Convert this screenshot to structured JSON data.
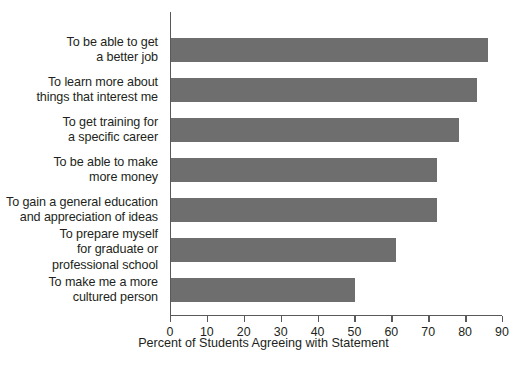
{
  "chart_data": {
    "type": "bar",
    "orientation": "horizontal",
    "title": "",
    "xlabel": "Percent of Students Agreeing with Statement",
    "ylabel": "",
    "xlim": [
      0,
      90
    ],
    "xticks": [
      0,
      10,
      20,
      30,
      40,
      50,
      60,
      70,
      80,
      90
    ],
    "grid": false,
    "legend": false,
    "bar_color": "#6e6e6e",
    "axis_color": "#58595b",
    "categories": [
      "To be able to get\na better job",
      "To learn more about\nthings that interest me",
      "To get training for\na specific career",
      "To be able to make\nmore money",
      "To gain a general education\nand appreciation of ideas",
      "To prepare myself\nfor graduate or\nprofessional school",
      "To make me a more\ncultured person"
    ],
    "values": [
      86,
      83,
      78,
      72,
      72,
      61,
      50
    ]
  }
}
